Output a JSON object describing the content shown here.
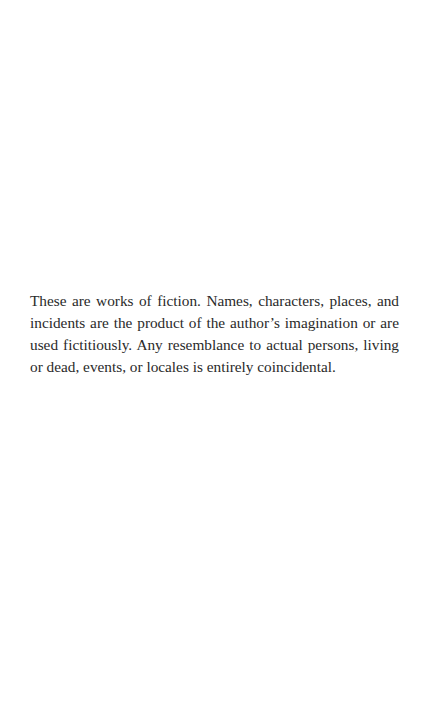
{
  "page": {
    "disclaimer": "These are works of fiction. Names, characters, places, and incidents are the product of the author’s imagination or are used fictitiously. Any resemblance to actual persons, living or dead, events, or locales is entirely coincidental."
  }
}
